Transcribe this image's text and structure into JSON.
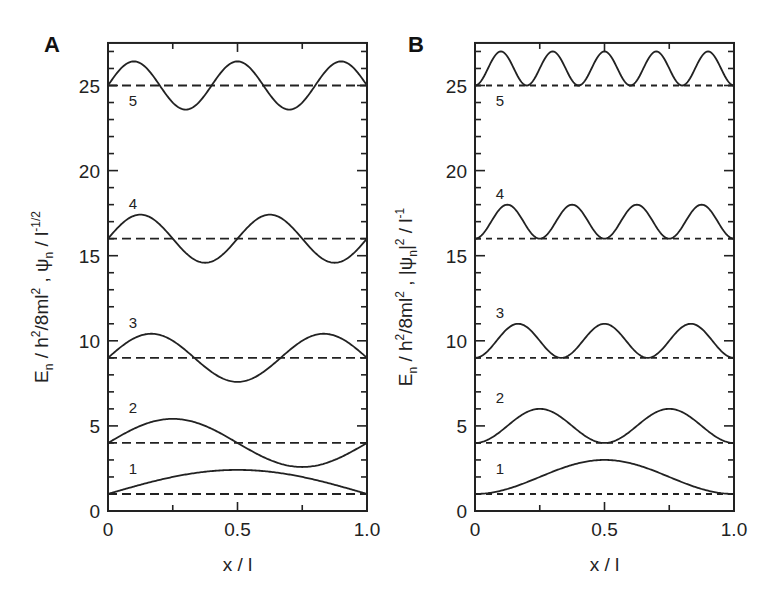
{
  "chart_data": [
    {
      "panel": "A",
      "type": "line",
      "title": "",
      "xlabel": "x / l",
      "ylabel": "E_n / h^2/8ml^2 , ψ_n / l^-1/2",
      "ylabel_parts": {
        "e": "E",
        "e_sub": "n",
        "mid1": " / h",
        "sup1": "2",
        "mid2": "/8ml",
        "sup2": "2",
        "mid3": " ,  ψ",
        "psi_sub": "n",
        "mid4": " / l",
        "sup3": "-1/2"
      },
      "xlim": [
        0,
        1.0
      ],
      "ylim": [
        0,
        27.5
      ],
      "xticks": [
        0,
        0.5,
        1.0
      ],
      "xtick_labels": [
        "0",
        "0.5",
        "1.0"
      ],
      "yticks": [
        0,
        5,
        10,
        15,
        20,
        25
      ],
      "ytick_labels": [
        "0",
        "5",
        "10",
        "15",
        "20",
        "25"
      ],
      "grid": false,
      "function": "psi",
      "amplitude": 1.414,
      "series": [
        {
          "name": "1",
          "n": 1,
          "energy": 1
        },
        {
          "name": "2",
          "n": 2,
          "energy": 4
        },
        {
          "name": "3",
          "n": 3,
          "energy": 9
        },
        {
          "name": "4",
          "n": 4,
          "energy": 16
        },
        {
          "name": "5",
          "n": 5,
          "energy": 25
        }
      ],
      "energy_levels_dashed": [
        1,
        4,
        9,
        16,
        25
      ]
    },
    {
      "panel": "B",
      "type": "line",
      "title": "",
      "xlabel": "x / l",
      "ylabel": "E_n / h^2/8ml^2 , |ψ_n|^2 / l^-1",
      "ylabel_parts": {
        "e": "E",
        "e_sub": "n",
        "mid1": " / h",
        "sup1": "2",
        "mid2": "/8ml",
        "sup2": "2",
        "mid3": " ,  |ψ",
        "psi_sub": "n",
        "mid4": "|",
        "sup_abs": "2",
        "mid5": " / l",
        "sup3": "-1"
      },
      "xlim": [
        0,
        1.0
      ],
      "ylim": [
        0,
        27.5
      ],
      "xticks": [
        0,
        0.5,
        1.0
      ],
      "xtick_labels": [
        "0",
        "0.5",
        "1.0"
      ],
      "yticks": [
        0,
        5,
        10,
        15,
        20,
        25
      ],
      "ytick_labels": [
        "0",
        "5",
        "10",
        "15",
        "20",
        "25"
      ],
      "grid": false,
      "function": "psi_squared",
      "amplitude": 2.0,
      "series": [
        {
          "name": "1",
          "n": 1,
          "energy": 1
        },
        {
          "name": "2",
          "n": 2,
          "energy": 4
        },
        {
          "name": "3",
          "n": 3,
          "energy": 9
        },
        {
          "name": "4",
          "n": 4,
          "energy": 16
        },
        {
          "name": "5",
          "n": 5,
          "energy": 25
        }
      ],
      "energy_levels_dashed": [
        1,
        4,
        9,
        16,
        25
      ]
    }
  ],
  "layout": {
    "panels": [
      {
        "letter": "A",
        "x0": 108,
        "x1": 367,
        "letter_x": 44,
        "letter_y": 52,
        "ylabel_x": 48
      },
      {
        "letter": "B",
        "x0": 475,
        "x1": 734,
        "letter_x": 408,
        "letter_y": 52,
        "ylabel_x": 412
      }
    ],
    "y0_px": 511,
    "px_per_unit": 17.02
  }
}
